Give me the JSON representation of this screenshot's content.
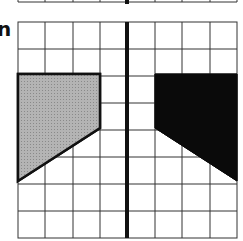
{
  "figure": {
    "label": "n",
    "grid": {
      "columns": 8,
      "rows": 8,
      "visible_top_strip_row": true
    },
    "mirror_line": {
      "orientation": "vertical",
      "position": "center",
      "color": "#111111"
    },
    "shapes": [
      {
        "name": "original",
        "fill": "#a8a8a8",
        "vertices_grid": [
          [
            0,
            2
          ],
          [
            3,
            2
          ],
          [
            3,
            4
          ],
          [
            0,
            6
          ]
        ]
      },
      {
        "name": "reflection",
        "fill": "#0a0a0a",
        "vertices_grid": [
          [
            5,
            2
          ],
          [
            8,
            2
          ],
          [
            8,
            6
          ],
          [
            5,
            4
          ]
        ]
      }
    ],
    "colors": {
      "grid_line": "#333333",
      "background": "#ffffff"
    }
  }
}
